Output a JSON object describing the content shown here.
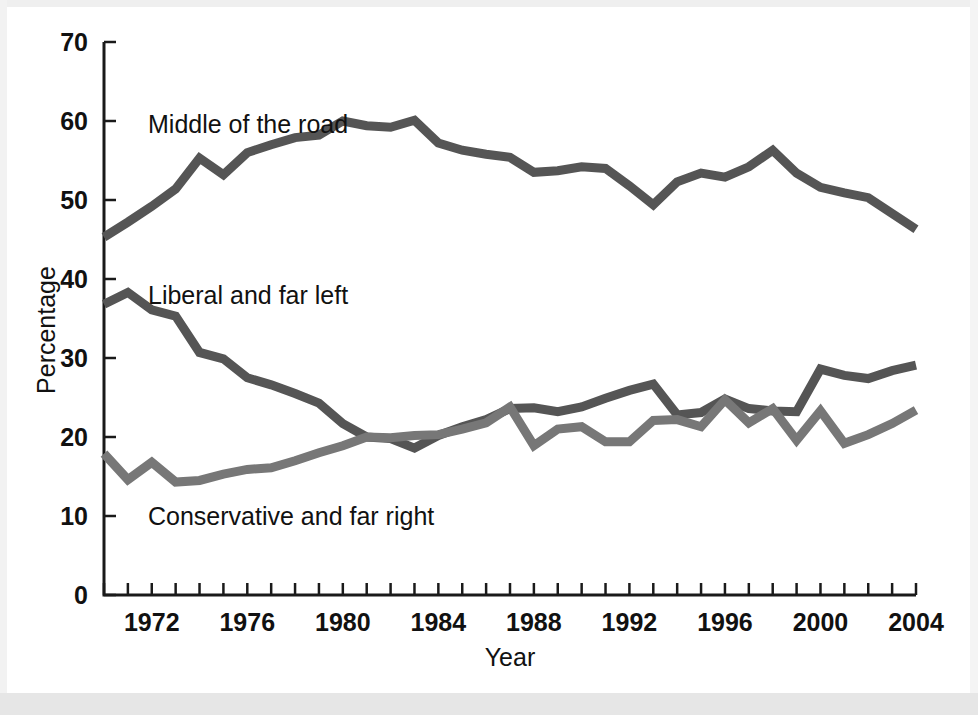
{
  "figure": {
    "background_color": "#ffffff",
    "line_color": "#555555",
    "axis_color": "#1a1a1a"
  },
  "axes": {
    "y_title": "Percentage",
    "x_title": "Year",
    "y_ticks": [
      "0",
      "10",
      "20",
      "30",
      "40",
      "50",
      "60",
      "70"
    ],
    "x_ticks": [
      "1972",
      "1976",
      "1980",
      "1984",
      "1988",
      "1992",
      "1996",
      "2000",
      "2004"
    ]
  },
  "annotations": [
    {
      "name": "middle-of-the-road-label",
      "text": "Middle of the road",
      "x": 148,
      "y": 133
    },
    {
      "name": "liberal-and-far-left-label",
      "text": "Liberal and far left",
      "x": 148,
      "y": 304
    },
    {
      "name": "conservative-and-far-right-label",
      "text": "Conservative and far right",
      "x": 148,
      "y": 525
    }
  ],
  "chart_data": {
    "type": "line",
    "title": "",
    "xlabel": "Year",
    "ylabel": "Percentage",
    "xlim": [
      1970,
      2004
    ],
    "ylim": [
      0,
      70
    ],
    "grid": false,
    "legend": "inline-annotations",
    "x": [
      1970,
      1971,
      1972,
      1973,
      1974,
      1975,
      1976,
      1977,
      1978,
      1979,
      1980,
      1981,
      1982,
      1983,
      1984,
      1985,
      1986,
      1987,
      1988,
      1989,
      1990,
      1991,
      1992,
      1993,
      1994,
      1995,
      1996,
      1997,
      1998,
      1999,
      2000,
      2001,
      2002,
      2003,
      2004
    ],
    "series": [
      {
        "name": "Middle of the road",
        "color": "#555555",
        "values": [
          45.3,
          47.2,
          49.2,
          51.4,
          55.3,
          53.2,
          56.0,
          57.0,
          57.9,
          58.2,
          60.0,
          59.4,
          59.2,
          60.1,
          57.2,
          56.3,
          55.8,
          55.4,
          53.5,
          53.7,
          54.2,
          54.0,
          51.8,
          49.4,
          52.3,
          53.4,
          52.9,
          54.2,
          56.3,
          53.4,
          51.6,
          50.9,
          50.3,
          48.3,
          46.3
        ]
      },
      {
        "name": "Liberal and far left",
        "color": "#555555",
        "values": [
          36.8,
          38.3,
          36.1,
          35.3,
          30.7,
          29.9,
          27.5,
          26.6,
          25.5,
          24.3,
          21.7,
          20.0,
          19.8,
          18.6,
          20.2,
          21.3,
          22.2,
          23.6,
          23.7,
          23.2,
          23.8,
          24.9,
          25.9,
          26.7,
          22.8,
          23.1,
          24.8,
          23.6,
          23.3,
          23.2,
          28.6,
          27.8,
          27.4,
          28.4,
          29.1
        ]
      },
      {
        "name": "Conservative and far right",
        "color": "#777777",
        "values": [
          17.9,
          14.6,
          16.8,
          14.3,
          14.5,
          15.3,
          15.9,
          16.1,
          17.0,
          18.0,
          18.9,
          20.0,
          19.9,
          20.2,
          20.3,
          21.0,
          21.8,
          23.8,
          18.9,
          21.0,
          21.3,
          19.4,
          19.4,
          22.1,
          22.2,
          21.3,
          24.7,
          21.8,
          23.6,
          19.6,
          23.3,
          19.2,
          20.3,
          21.7,
          23.4
        ]
      }
    ]
  }
}
